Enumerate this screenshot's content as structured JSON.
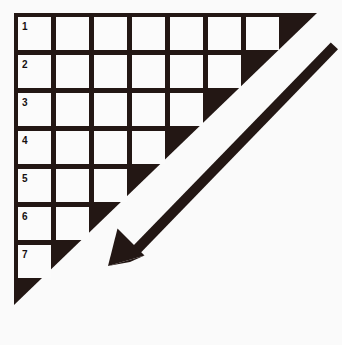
{
  "figure": {
    "background_color": "#fafafa",
    "ink_color": "#231714",
    "cell_color": "#fbfbfb",
    "width": 342,
    "height": 345
  },
  "triangle": {
    "description": "Solid black right triangle, right angle at top-left",
    "vertices": [
      [
        14,
        13
      ],
      [
        317,
        13
      ],
      [
        14,
        305
      ]
    ],
    "fill": "#231714"
  },
  "grid": {
    "description": "Staircase of white square cells inset in the black triangle",
    "origin_x": 18,
    "origin_y": 17,
    "cell_size": 33,
    "cell_pitch": 38,
    "row_count": 7,
    "cells_per_row": [
      7,
      6,
      5,
      4,
      3,
      2,
      1
    ],
    "total_cells": 28,
    "rows": [
      {
        "label": "1",
        "cells": 7
      },
      {
        "label": "2",
        "cells": 6
      },
      {
        "label": "3",
        "cells": 5
      },
      {
        "label": "4",
        "cells": 4
      },
      {
        "label": "5",
        "cells": 3
      },
      {
        "label": "6",
        "cells": 2
      },
      {
        "label": "7",
        "cells": 1
      }
    ]
  },
  "arrow": {
    "description": "Thick black arrow running from upper-right to lower-left, head at lower-left",
    "tail": [
      334,
      47
    ],
    "tip": [
      108,
      266
    ],
    "shaft_width": 9,
    "head_length": 36,
    "head_width": 30,
    "direction": "down-left",
    "color": "#231714"
  }
}
